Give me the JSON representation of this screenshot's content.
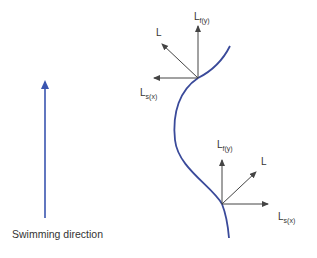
{
  "diagram": {
    "caption": "Swimming direction",
    "colors": {
      "body_curve": "#3a4a9a",
      "direction_arrow": "#3a55b0",
      "vectors": "#444444",
      "text": "#333333"
    },
    "upper_vectors": {
      "lift": {
        "main": "L",
        "sub": ""
      },
      "forward": {
        "main": "L",
        "sub": "f(y)"
      },
      "side": {
        "main": "L",
        "sub": "s(x)"
      }
    },
    "lower_vectors": {
      "lift": {
        "main": "L",
        "sub": ""
      },
      "forward": {
        "main": "L",
        "sub": "f(y)"
      },
      "side": {
        "main": "L",
        "sub": "s(x)"
      }
    }
  }
}
